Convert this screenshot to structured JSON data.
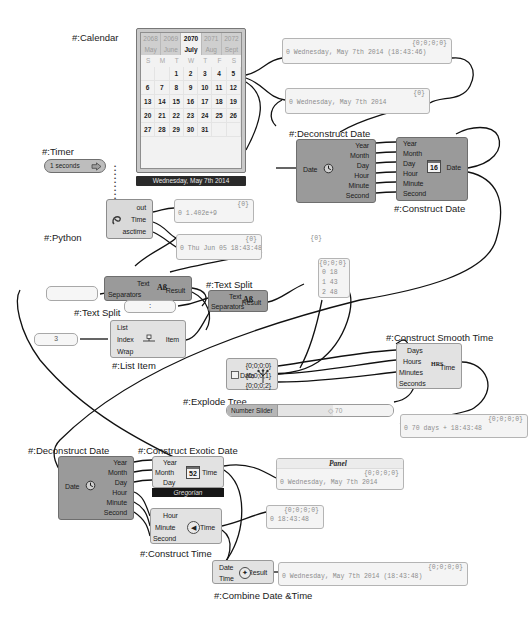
{
  "app": {
    "title": "Grasshopper Date & Time Definition Canvas",
    "background": "#ffffff",
    "node_color": "#9a9a9a",
    "panel_color": "#f4f4f4",
    "wire_color": "#1a1a1a"
  },
  "calendar": {
    "label": "#:Calendar",
    "years": [
      {
        "text": "2068",
        "selected": false
      },
      {
        "text": "2069",
        "selected": false
      },
      {
        "text": "2070",
        "selected": true
      },
      {
        "text": "2071",
        "selected": false
      },
      {
        "text": "2072",
        "selected": false
      }
    ],
    "months": [
      {
        "text": "May",
        "selected": false
      },
      {
        "text": "June",
        "selected": false
      },
      {
        "text": "July",
        "selected": true
      },
      {
        "text": "Aug",
        "selected": false
      },
      {
        "text": "Sept",
        "selected": false
      }
    ],
    "dow": [
      "S",
      "M",
      "T",
      "W",
      "T",
      "F",
      "S"
    ],
    "days": [
      "",
      "",
      "1",
      "2",
      "3",
      "4",
      "5",
      "6",
      "7",
      "8",
      "9",
      "10",
      "11",
      "12",
      "13",
      "14",
      "15",
      "16",
      "17",
      "18",
      "19",
      "20",
      "21",
      "22",
      "23",
      "24",
      "25",
      "26",
      "27",
      "28",
      "29",
      "30",
      "31",
      "",
      ""
    ],
    "footer": "Wednesday, May 7th 2014"
  },
  "timer": {
    "label": "#:Timer",
    "value": "1 seconds",
    "icon": "play-arrow-icon"
  },
  "python": {
    "label": "#:Python",
    "inputs": [],
    "outputs": [
      "out",
      "Time",
      "asctime"
    ],
    "icon": "python-icon"
  },
  "deconstruct_date_top": {
    "label": "#:Deconstruct Date",
    "inputs": [
      "Date"
    ],
    "outputs": [
      "Year",
      "Month",
      "Day",
      "Hour",
      "Minute",
      "Second"
    ],
    "icon": "clock-icon"
  },
  "construct_date": {
    "label": "#:Construct Date",
    "inputs": [
      "Year",
      "Month",
      "Day",
      "Hour",
      "Minute",
      "Second"
    ],
    "outputs": [
      "Date"
    ],
    "icon": "calendar-16-icon",
    "icon_text": "16"
  },
  "text_split_1": {
    "label": "#:Text Split",
    "inputs": [
      "Text",
      "Separators"
    ],
    "outputs": [
      "Result"
    ],
    "icon": "ab-text-icon",
    "icon_text": "Aß"
  },
  "text_split_2": {
    "label": "#:Text Split",
    "inputs": [
      "Text",
      "Separators"
    ],
    "outputs": [
      "Result"
    ],
    "icon": "ab-text-icon",
    "icon_text": "Aß"
  },
  "list_item": {
    "label": "#:List Item",
    "inputs": [
      "List",
      "Index",
      "Wrap"
    ],
    "outputs": [
      "Item"
    ],
    "icon": "list-item-icon"
  },
  "explode_tree": {
    "label": "#:Explode Tree",
    "inputs": [
      "Data"
    ],
    "outputs": [
      "{0;0;0;0}",
      "{0;0;0;1}",
      "{0;0;0;2}"
    ],
    "icon": "tree-icon"
  },
  "construct_smooth_time": {
    "label": "#:Construct Smooth Time",
    "inputs": [
      "Days",
      "Hours",
      "Minutes",
      "Seconds"
    ],
    "outputs": [
      "Time"
    ],
    "icon": "hrs-icon",
    "icon_text": "HRS"
  },
  "deconstruct_date_bottom": {
    "label": "#:Deconstruct Date",
    "inputs": [
      "Date"
    ],
    "outputs": [
      "Year",
      "Month",
      "Day",
      "Hour",
      "Minute",
      "Second"
    ],
    "icon": "clock-icon"
  },
  "construct_exotic_date": {
    "label": "#:Construct Exotic Date",
    "inputs": [
      "Year",
      "Month",
      "Day"
    ],
    "outputs": [
      "Time"
    ],
    "icon": "calendar-52-icon",
    "icon_text": "52",
    "calendar_type": "Gregorian"
  },
  "construct_time": {
    "label": "#:Construct Time",
    "inputs": [
      "Hour",
      "Minute",
      "Second"
    ],
    "outputs": [
      "Time"
    ],
    "icon": "clock-face-icon"
  },
  "combine_date_time": {
    "label": "#:Combine Date &Time",
    "inputs": [
      "Date",
      "Time"
    ],
    "outputs": [
      "Result"
    ],
    "icon": "merge-icon"
  },
  "number_slider": {
    "label": "Number Slider",
    "value": "70",
    "handle": "◇"
  },
  "value_3": "3",
  "value_colon": ":",
  "value_empty": "",
  "panels": [
    {
      "name": "panel-datetime-top",
      "path": "{0;0;0;0}",
      "lines": [
        "0 Wednesday, May 7th 2014 (18:43:46)"
      ]
    },
    {
      "name": "panel-date-top",
      "path": "{0}",
      "lines": [
        "0 Wednesday, May 7th 2014"
      ]
    },
    {
      "name": "panel-python-time",
      "path": "{0}",
      "lines": [
        "0 1.402e+9"
      ]
    },
    {
      "name": "panel-python-asctime",
      "path": "{0}",
      "lines": [
        "0 Thu Jun 05 18:43:48 2014"
      ]
    },
    {
      "name": "panel-split-values",
      "path": "{0;0;0}",
      "lines": [
        "0 18",
        "1 43",
        "2 48"
      ]
    },
    {
      "name": "panel-smooth-time",
      "path": "{0;0;0;0}",
      "lines": [
        "0 70 days + 18:43:48"
      ]
    },
    {
      "name": "panel-exotic-date",
      "title": "Panel",
      "path": "{0;0;0;0}",
      "lines": [
        "0 Wednesday, May 7th 2014"
      ]
    },
    {
      "name": "panel-construct-time",
      "path": "{0;0;0;0}",
      "lines": [
        "0 18:43:48"
      ]
    },
    {
      "name": "panel-combined-datetime",
      "path": "{0;0;0;0}",
      "lines": [
        "0 Wednesday, May 7th 2014 (18:43:48)"
      ]
    }
  ]
}
